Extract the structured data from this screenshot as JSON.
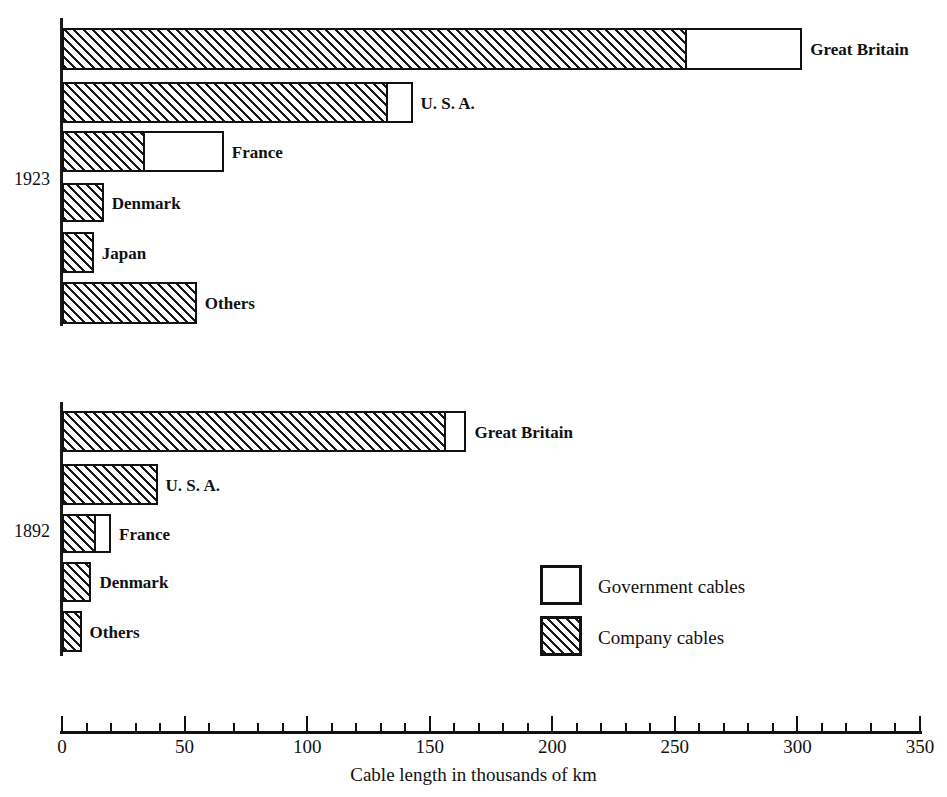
{
  "chart_data": {
    "type": "bar",
    "orientation": "horizontal",
    "title": "",
    "xlabel": "Cable length in thousands of km",
    "ylabel": "",
    "xlim": [
      0,
      350
    ],
    "xticks": [
      0,
      50,
      100,
      150,
      200,
      250,
      300,
      350
    ],
    "xtick_labels": [
      "0",
      "50",
      "100",
      "150",
      "200",
      "250",
      "300",
      "350"
    ],
    "minor_tick_step": 10,
    "grid": false,
    "stacked": true,
    "legend": {
      "position": "inside-right",
      "entries": [
        {
          "name": "Government cables",
          "fill": "white"
        },
        {
          "name": "Company cables",
          "fill": "hatched"
        }
      ]
    },
    "series": [
      {
        "name": "Company cables",
        "fill": "hatched"
      },
      {
        "name": "Government cables",
        "fill": "white"
      }
    ],
    "groups": [
      {
        "label": "1923",
        "categories": [
          "Great Britain",
          "U. S. A.",
          "France",
          "Denmark",
          "Japan",
          "Others"
        ],
        "company_cables": [
          254,
          132,
          33,
          17,
          13,
          55
        ],
        "government_cables": [
          48,
          11,
          33,
          0,
          0,
          0
        ],
        "totals": [
          302,
          143,
          66,
          17,
          13,
          55
        ]
      },
      {
        "label": "1892",
        "categories": [
          "Great Britain",
          "U. S. A.",
          "France",
          "Denmark",
          "Others"
        ],
        "company_cables": [
          156,
          39,
          13,
          12,
          8
        ],
        "government_cables": [
          9,
          0,
          7,
          0,
          0
        ],
        "totals": [
          165,
          39,
          20,
          12,
          8
        ]
      }
    ]
  },
  "colors": {
    "ink": "#111111",
    "background": "#ffffff"
  }
}
